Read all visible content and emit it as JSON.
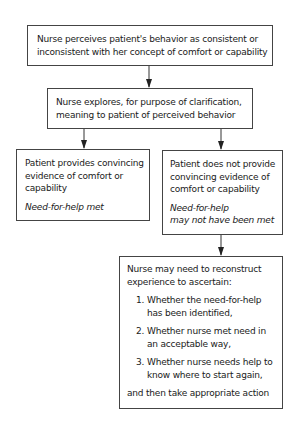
{
  "diagram": {
    "type": "flowchart",
    "nodes": {
      "perceive": {
        "lines": [
          "Nurse perceives patient's behavior as consistent or",
          "inconsistent with her concept of comfort or capability"
        ]
      },
      "explore": {
        "lines": [
          "Nurse explores, for purpose of clarification,",
          "meaning to patient of perceived behavior"
        ]
      },
      "convincing": {
        "lines": [
          "Patient provides convincing",
          "evidence of comfort or",
          "capability"
        ],
        "outcome": "Need-for-help met"
      },
      "not_convincing": {
        "lines": [
          "Patient does not provide",
          "convincing evidence of",
          "comfort or capability"
        ],
        "outcome_lines": [
          "Need-for-help",
          "may not have been met"
        ]
      },
      "reconstruct": {
        "intro_lines": [
          "Nurse may need to reconstruct",
          "experience to ascertain:"
        ],
        "items": [
          {
            "num": "1.",
            "lines": [
              "Whether the need-for-help",
              "has been identified,"
            ]
          },
          {
            "num": "2.",
            "lines": [
              "Whether nurse met need in",
              "an acceptable way,"
            ]
          },
          {
            "num": "3.",
            "lines": [
              "Whether nurse needs help to",
              "know where to start again,"
            ]
          }
        ],
        "closing": "and then take appropriate action"
      }
    },
    "edges": [
      {
        "from": "perceive",
        "to": "explore"
      },
      {
        "from": "explore",
        "to": "convincing"
      },
      {
        "from": "explore",
        "to": "not_convincing"
      },
      {
        "from": "not_convincing",
        "to": "reconstruct"
      }
    ],
    "colors": {
      "line": "#444444",
      "text": "#1a1a1a",
      "background": "#ffffff"
    }
  }
}
